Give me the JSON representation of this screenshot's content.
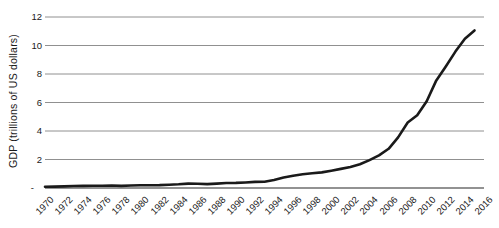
{
  "colors": {
    "line": "#1a1a1a",
    "gridline": "#909090",
    "axis_line": "#6e6e6e",
    "text": "#1a1a1a",
    "background": "#ffffff"
  },
  "chart_data": {
    "type": "line",
    "title": "",
    "xlabel": "",
    "ylabel": "GDP (trillions of US dollars)",
    "grid": "horizontal-only",
    "legend_position": "none",
    "x_range": [
      1970,
      2016
    ],
    "ylim": [
      0,
      12
    ],
    "y_ticks": {
      "values": [
        12,
        10,
        8,
        6,
        4,
        2,
        0
      ],
      "labels": [
        "12",
        "10",
        "8",
        "6",
        "4",
        "2",
        "-"
      ]
    },
    "x_tick_years": [
      1970,
      1972,
      1974,
      1976,
      1978,
      1980,
      1982,
      1984,
      1986,
      1988,
      1990,
      1992,
      1994,
      1996,
      1998,
      2000,
      2002,
      2004,
      2006,
      2008,
      2010,
      2012,
      2014,
      2016
    ],
    "series": [
      {
        "name": "GDP",
        "color": "#1a1a1a",
        "x": [
          1970,
          1971,
          1972,
          1973,
          1974,
          1975,
          1976,
          1977,
          1978,
          1979,
          1980,
          1981,
          1982,
          1983,
          1984,
          1985,
          1986,
          1987,
          1988,
          1989,
          1990,
          1991,
          1992,
          1993,
          1994,
          1995,
          1996,
          1997,
          1998,
          1999,
          2000,
          2001,
          2002,
          2003,
          2004,
          2005,
          2006,
          2007,
          2008,
          2009,
          2010,
          2011,
          2012,
          2013,
          2014,
          2015
        ],
        "values": [
          0.093,
          0.099,
          0.113,
          0.139,
          0.144,
          0.163,
          0.154,
          0.175,
          0.15,
          0.178,
          0.191,
          0.196,
          0.205,
          0.231,
          0.26,
          0.309,
          0.301,
          0.273,
          0.312,
          0.348,
          0.361,
          0.383,
          0.427,
          0.445,
          0.564,
          0.734,
          0.864,
          0.962,
          1.029,
          1.094,
          1.211,
          1.339,
          1.471,
          1.66,
          1.955,
          2.286,
          2.752,
          3.55,
          4.594,
          5.102,
          6.087,
          7.552,
          8.532,
          9.57,
          10.476,
          11.062
        ]
      }
    ]
  }
}
